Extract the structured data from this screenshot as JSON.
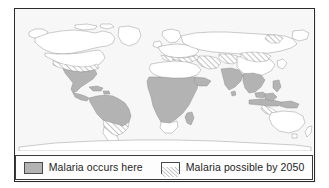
{
  "figure": {
    "map": {
      "projection": "equirectangular",
      "ocean_color": "#f7f7f7",
      "land_color": "#ffffff",
      "coastline_color": "#8c8c8c",
      "border_color": "#a8a8a8",
      "occurs_fill": "#b3b3b3",
      "possible_fill": "#ffffff",
      "hatch_color": "#8a8a8a",
      "regions_occurs": [
        "Mexico",
        "Central America",
        "Caribbean",
        "Colombia",
        "Venezuela",
        "Guyana",
        "Brazil (north)",
        "Peru",
        "Bolivia",
        "Sub-Saharan Africa",
        "Madagascar",
        "Yemen",
        "India",
        "Bangladesh",
        "Myanmar",
        "Thailand",
        "Vietnam",
        "Indonesia",
        "Philippines",
        "Papua New Guinea"
      ],
      "regions_possible_by_2050": [
        "Southern United States",
        "Southern Brazil",
        "Northern Argentina",
        "Mediterranean Europe",
        "Turkey",
        "Middle East",
        "Central Asia",
        "Northern China",
        "Mongolia",
        "Eastern Siberia",
        "Coral Sea / Pacific islands"
      ]
    },
    "legend": {
      "entries": [
        {
          "pattern": "solid-gray",
          "label": "Malaria occurs here",
          "icon": "solid-swatch-icon"
        },
        {
          "pattern": "diagonal-hatch",
          "label": "Malaria possible by 2050",
          "icon": "hatch-swatch-icon"
        }
      ]
    }
  }
}
